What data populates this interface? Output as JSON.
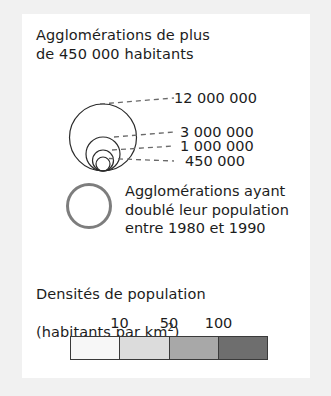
{
  "legend": {
    "agglomerations": {
      "title": "Agglomérations de plus\nde 450 000 habitants",
      "circles": [
        {
          "label": "12 000 000",
          "value": 12000000
        },
        {
          "label": "3 000 000",
          "value": 3000000
        },
        {
          "label": "1 000 000",
          "value": 1000000
        },
        {
          "label": "450 000",
          "value": 450000
        }
      ]
    },
    "doubled": {
      "caption": "Agglomérations ayant\ndoublé leur population\nentre 1980 et 1990",
      "ring_color": "#7d7d7d"
    },
    "density": {
      "title_line1": "Densités de population",
      "title_line2_prefix": "(habitants par km",
      "title_line2_exponent": "2",
      "title_line2_suffix": ")",
      "ticks": [
        "10",
        "50",
        "100"
      ],
      "swatches": [
        {
          "color": "#f7f7f7"
        },
        {
          "color": "#dcdcdc"
        },
        {
          "color": "#a8a8a8"
        },
        {
          "color": "#6e6e6e"
        }
      ]
    }
  }
}
